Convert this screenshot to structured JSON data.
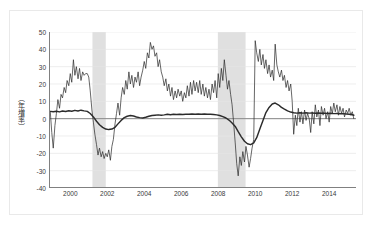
{
  "chart_data": {
    "type": "line",
    "title": "",
    "xlabel": "",
    "ylabel": "（年増率）",
    "ylim": [
      -40,
      50
    ],
    "xlim": [
      1998.85,
      2015.45
    ],
    "yticks": [
      50,
      40,
      30,
      20,
      10,
      0,
      -10,
      -20,
      -30,
      -40
    ],
    "xticks": [
      2000,
      2002,
      2004,
      2006,
      2008,
      2010,
      2012,
      2014
    ],
    "grid": "horizontal",
    "legend_position": "none",
    "zero_line": 0,
    "colors": {
      "volatile_series": "#2b2b2b",
      "smooth_series": "#2b2b2b",
      "grid": "#e6e6e6",
      "zero_line": "#888888",
      "axis": "#808080",
      "recession_band": "#e0e0e0",
      "frame": "#e9e9e9",
      "background": "#ffffff"
    },
    "shaded_regions": [
      {
        "name": "recession-band-2001",
        "x0": 2001.2,
        "x1": 2001.92
      },
      {
        "name": "recession-band-2008",
        "x0": 2007.98,
        "x1": 2009.48
      }
    ],
    "series": [
      {
        "name": "volatile-series",
        "style": "thin",
        "x": [
          1998.92,
          1999.0,
          1999.08,
          1999.17,
          1999.25,
          1999.33,
          1999.42,
          1999.5,
          1999.58,
          1999.67,
          1999.75,
          1999.83,
          1999.92,
          2000.0,
          2000.08,
          2000.17,
          2000.25,
          2000.33,
          2000.42,
          2000.5,
          2000.58,
          2000.67,
          2000.75,
          2000.83,
          2000.92,
          2001.0,
          2001.08,
          2001.17,
          2001.25,
          2001.33,
          2001.42,
          2001.5,
          2001.58,
          2001.67,
          2001.75,
          2001.83,
          2001.92,
          2002.0,
          2002.08,
          2002.17,
          2002.25,
          2002.33,
          2002.42,
          2002.5,
          2002.58,
          2002.67,
          2002.75,
          2002.83,
          2002.92,
          2003.0,
          2003.08,
          2003.17,
          2003.25,
          2003.33,
          2003.42,
          2003.5,
          2003.58,
          2003.67,
          2003.75,
          2003.83,
          2003.92,
          2004.0,
          2004.08,
          2004.17,
          2004.25,
          2004.33,
          2004.42,
          2004.5,
          2004.58,
          2004.67,
          2004.75,
          2004.83,
          2004.92,
          2005.0,
          2005.08,
          2005.17,
          2005.25,
          2005.33,
          2005.42,
          2005.5,
          2005.58,
          2005.67,
          2005.75,
          2005.83,
          2005.92,
          2006.0,
          2006.08,
          2006.17,
          2006.25,
          2006.33,
          2006.42,
          2006.5,
          2006.58,
          2006.67,
          2006.75,
          2006.83,
          2006.92,
          2007.0,
          2007.08,
          2007.17,
          2007.25,
          2007.33,
          2007.42,
          2007.5,
          2007.58,
          2007.67,
          2007.75,
          2007.83,
          2007.92,
          2008.0,
          2008.08,
          2008.17,
          2008.25,
          2008.33,
          2008.42,
          2008.5,
          2008.58,
          2008.67,
          2008.75,
          2008.83,
          2008.92,
          2009.0,
          2009.08,
          2009.17,
          2009.25,
          2009.33,
          2009.42,
          2009.5,
          2009.58,
          2009.67,
          2009.75,
          2009.83,
          2009.92,
          2010.0,
          2010.08,
          2010.17,
          2010.25,
          2010.33,
          2010.42,
          2010.5,
          2010.58,
          2010.67,
          2010.75,
          2010.83,
          2010.92,
          2011.0,
          2011.08,
          2011.17,
          2011.25,
          2011.33,
          2011.42,
          2011.5,
          2011.58,
          2011.67,
          2011.75,
          2011.83,
          2011.92,
          2012.0,
          2012.08,
          2012.17,
          2012.25,
          2012.33,
          2012.42,
          2012.5,
          2012.58,
          2012.67,
          2012.75,
          2012.83,
          2012.92,
          2013.0,
          2013.08,
          2013.17,
          2013.25,
          2013.33,
          2013.42,
          2013.5,
          2013.58,
          2013.67,
          2013.75,
          2013.83,
          2013.92,
          2014.0,
          2014.08,
          2014.17,
          2014.25,
          2014.33,
          2014.42,
          2014.5,
          2014.58,
          2014.67,
          2014.75,
          2014.83,
          2014.92,
          2015.0,
          2015.08,
          2015.17,
          2015.25,
          2015.33
        ],
        "values": [
          4,
          -8,
          -17,
          -4,
          3,
          11,
          6,
          14,
          12,
          18,
          15,
          22,
          19,
          26,
          21,
          34,
          25,
          30,
          23,
          29,
          22,
          27,
          25,
          26,
          26,
          24,
          16,
          5,
          -2,
          -9,
          -15,
          -21,
          -17,
          -22,
          -19,
          -23,
          -20,
          -22,
          -18,
          -24,
          -16,
          -12,
          -3,
          3,
          9,
          2,
          12,
          18,
          14,
          22,
          17,
          27,
          20,
          25,
          18,
          24,
          21,
          27,
          19,
          24,
          28,
          33,
          29,
          38,
          35,
          44,
          40,
          42,
          36,
          38,
          30,
          34,
          27,
          24,
          19,
          23,
          16,
          20,
          13,
          18,
          11,
          16,
          12,
          17,
          13,
          16,
          10,
          15,
          12,
          19,
          13,
          21,
          14,
          22,
          16,
          21,
          15,
          22,
          14,
          20,
          13,
          18,
          12,
          17,
          11,
          20,
          15,
          22,
          12,
          26,
          18,
          29,
          22,
          34,
          25,
          17,
          22,
          14,
          8,
          -2,
          -14,
          -26,
          -33,
          -22,
          -27,
          -19,
          -25,
          -16,
          -21,
          -28,
          -23,
          -17,
          -12,
          45,
          38,
          33,
          40,
          31,
          37,
          29,
          34,
          26,
          31,
          24,
          28,
          22,
          43,
          31,
          27,
          24,
          28,
          22,
          25,
          18,
          22,
          16,
          20,
          10,
          -9,
          2,
          -4,
          6,
          -2,
          4,
          -3,
          5,
          -1,
          3,
          0,
          -8,
          4,
          -3,
          8,
          1,
          5,
          -4,
          7,
          2,
          6,
          0,
          4,
          -2,
          7,
          3,
          9,
          4,
          8,
          2,
          7,
          3,
          6,
          1,
          5,
          3,
          6,
          2,
          4,
          0
        ]
      },
      {
        "name": "smooth-series",
        "style": "thick",
        "x": [
          1998.92,
          1999.08,
          1999.25,
          1999.42,
          1999.58,
          1999.75,
          1999.92,
          2000.08,
          2000.25,
          2000.42,
          2000.58,
          2000.75,
          2000.92,
          2001.08,
          2001.25,
          2001.42,
          2001.58,
          2001.75,
          2001.92,
          2002.08,
          2002.25,
          2002.42,
          2002.58,
          2002.75,
          2002.92,
          2003.08,
          2003.25,
          2003.42,
          2003.58,
          2003.75,
          2003.92,
          2004.08,
          2004.25,
          2004.42,
          2004.58,
          2004.75,
          2004.92,
          2005.08,
          2005.25,
          2005.42,
          2005.58,
          2005.75,
          2005.92,
          2006.08,
          2006.25,
          2006.42,
          2006.58,
          2006.75,
          2006.92,
          2007.08,
          2007.25,
          2007.42,
          2007.58,
          2007.75,
          2007.92,
          2008.08,
          2008.25,
          2008.42,
          2008.58,
          2008.75,
          2008.92,
          2009.08,
          2009.25,
          2009.42,
          2009.58,
          2009.75,
          2009.92,
          2010.08,
          2010.25,
          2010.42,
          2010.58,
          2010.75,
          2010.92,
          2011.08,
          2011.25,
          2011.42,
          2011.58,
          2011.75,
          2011.92,
          2012.08,
          2012.25,
          2012.42,
          2012.58,
          2012.75,
          2012.92,
          2013.08,
          2013.25,
          2013.42,
          2013.58,
          2013.75,
          2013.92,
          2014.08,
          2014.25,
          2014.42,
          2014.58,
          2014.75,
          2014.92,
          2015.08,
          2015.25,
          2015.33
        ],
        "values": [
          4.2,
          4.0,
          4.3,
          3.9,
          4.4,
          4.1,
          4.6,
          4.3,
          4.8,
          4.4,
          4.9,
          4.5,
          4.2,
          3.0,
          1.0,
          -1.5,
          -3.5,
          -5.0,
          -6.0,
          -6.3,
          -6.0,
          -5.0,
          -3.0,
          -1.0,
          0.6,
          1.4,
          1.8,
          1.5,
          1.0,
          0.6,
          0.4,
          0.8,
          1.4,
          1.8,
          2.0,
          2.2,
          2.0,
          2.2,
          2.5,
          2.3,
          2.5,
          2.4,
          2.6,
          2.4,
          2.6,
          2.5,
          2.7,
          2.5,
          2.7,
          2.6,
          2.7,
          2.6,
          2.5,
          2.4,
          2.2,
          1.8,
          1.2,
          0.4,
          -0.8,
          -2.5,
          -4.5,
          -7.5,
          -10.5,
          -13.0,
          -14.5,
          -15.0,
          -14.0,
          -11.0,
          -6.0,
          -1.0,
          3.5,
          6.5,
          8.5,
          9.0,
          8.0,
          6.5,
          5.5,
          4.5,
          3.8,
          3.4,
          3.2,
          3.4,
          3.2,
          3.4,
          3.2,
          3.3,
          3.1,
          3.3,
          3.1,
          3.2,
          3.0,
          3.1,
          2.9,
          3.0,
          2.8,
          2.9,
          2.7,
          2.5,
          2.3,
          2.0
        ]
      }
    ]
  }
}
